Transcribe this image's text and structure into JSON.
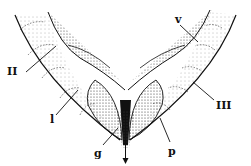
{
  "figure": {
    "type": "anatomical line drawing",
    "colors": {
      "ink": "#111111",
      "background": "#ffffff",
      "stipple": "#555555"
    }
  },
  "labels": {
    "II": "II",
    "l": "l",
    "g": "g",
    "v": "v",
    "III": "III",
    "p": "p"
  }
}
